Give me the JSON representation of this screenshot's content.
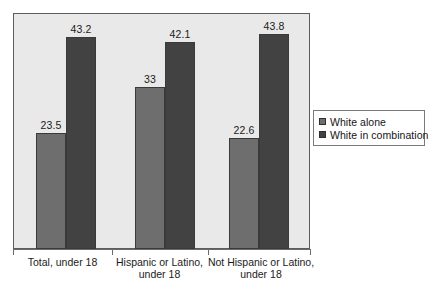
{
  "chart_data": {
    "type": "bar",
    "title": "",
    "subtitle": "",
    "xlabel": "",
    "ylabel": "",
    "ylim": [
      0,
      48
    ],
    "grid": false,
    "legend_position": "right",
    "categories": [
      "Total, under 18",
      "Hispanic or Latino,\nunder 18",
      "Not Hispanic or Latino,\nunder 18"
    ],
    "series": [
      {
        "name": "White alone",
        "color": "#6e6e6e",
        "values": [
          23.5,
          33,
          22.6
        ],
        "labels": [
          "23.5",
          "33",
          "22.6"
        ]
      },
      {
        "name": "White in combination",
        "color": "#424242",
        "values": [
          43.2,
          42.1,
          43.8
        ],
        "labels": [
          "43.2",
          "42.1",
          "43.8"
        ]
      }
    ]
  },
  "legend": {
    "items": [
      {
        "label": "White alone",
        "color": "#6e6e6e"
      },
      {
        "label": "White in combination",
        "color": "#424242"
      }
    ]
  },
  "axis": {
    "categories": [
      "Total, under 18",
      "Hispanic or Latino,\nunder 18",
      "Not Hispanic or Latino,\nunder 18"
    ]
  },
  "colors": {
    "plot_background": "#e9e9e9",
    "plot_border": "#5c5c5c",
    "series_white_alone": "#6e6e6e",
    "series_white_in_combination": "#424242",
    "text": "#1b1b1b"
  }
}
